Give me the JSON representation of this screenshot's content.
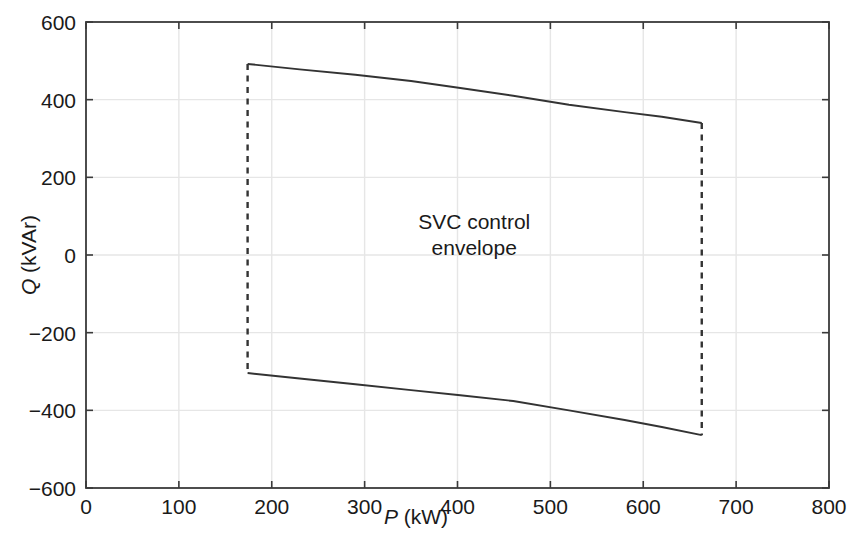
{
  "chart_data": {
    "type": "line",
    "title": "",
    "xlabel": "P (kW)",
    "xlabel_symbol": "P",
    "xlabel_unit": "(kW)",
    "ylabel": "Q (kVAr)",
    "ylabel_symbol": "Q",
    "ylabel_unit": "(kVAr)",
    "xlim": [
      0,
      800
    ],
    "ylim": [
      -600,
      600
    ],
    "xticks": [
      0,
      100,
      200,
      300,
      400,
      500,
      600,
      700,
      800
    ],
    "xtick_labels": [
      "0",
      "100",
      "200",
      "300",
      "400",
      "500",
      "600",
      "700",
      "800"
    ],
    "yticks": [
      -600,
      -400,
      -200,
      0,
      200,
      400,
      600
    ],
    "ytick_labels": [
      "−600",
      "−400",
      "−200",
      "0",
      "200",
      "400",
      "600"
    ],
    "grid": true,
    "grid_color": "#e6e6e6",
    "axis_color": "#3a3a3a",
    "curve_color": "#333333",
    "annotations": [
      {
        "text": "SVC control\nenvelope",
        "x": 418,
        "y": 50
      }
    ],
    "series": [
      {
        "name": "upper boundary",
        "style": "solid",
        "points": [
          {
            "x": 174,
            "y": 492
          },
          {
            "x": 230,
            "y": 478
          },
          {
            "x": 290,
            "y": 464
          },
          {
            "x": 350,
            "y": 448
          },
          {
            "x": 403,
            "y": 430
          },
          {
            "x": 460,
            "y": 410
          },
          {
            "x": 520,
            "y": 387
          },
          {
            "x": 580,
            "y": 368
          },
          {
            "x": 620,
            "y": 356
          },
          {
            "x": 663,
            "y": 340
          }
        ]
      },
      {
        "name": "lower boundary",
        "style": "solid",
        "points": [
          {
            "x": 174,
            "y": -304
          },
          {
            "x": 230,
            "y": -318
          },
          {
            "x": 290,
            "y": -333
          },
          {
            "x": 350,
            "y": -348
          },
          {
            "x": 403,
            "y": -361
          },
          {
            "x": 460,
            "y": -376
          },
          {
            "x": 520,
            "y": -400
          },
          {
            "x": 580,
            "y": -425
          },
          {
            "x": 620,
            "y": -443
          },
          {
            "x": 663,
            "y": -464
          }
        ]
      },
      {
        "name": "left boundary",
        "style": "dashed",
        "points": [
          {
            "x": 174,
            "y": 492
          },
          {
            "x": 174,
            "y": -304
          }
        ]
      },
      {
        "name": "right boundary",
        "style": "dashed",
        "points": [
          {
            "x": 663,
            "y": 340
          },
          {
            "x": 663,
            "y": -464
          }
        ]
      }
    ]
  }
}
